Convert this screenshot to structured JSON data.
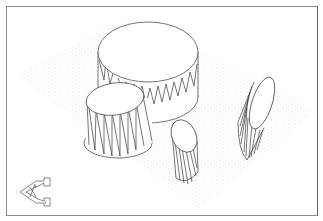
{
  "drawing": {
    "view": "isometric",
    "background": "#ffffff",
    "line_color": "#3a3a3a",
    "grid_dot_color": "#d4d4d4",
    "border_color": "#8a8a8a"
  },
  "objects": [
    {
      "name": "large-cylinder",
      "type": "cylinder",
      "orientation": "vertical"
    },
    {
      "name": "small-cylinder",
      "type": "cylinder",
      "orientation": "vertical"
    },
    {
      "name": "elliptical-cylinder-front",
      "type": "cylinder",
      "orientation": "angled"
    },
    {
      "name": "elliptical-cylinder-right",
      "type": "cylinder",
      "orientation": "tilted"
    }
  ],
  "ucs_icon": {
    "name": "ucs-icon",
    "labels": [
      "X",
      "Y"
    ]
  }
}
